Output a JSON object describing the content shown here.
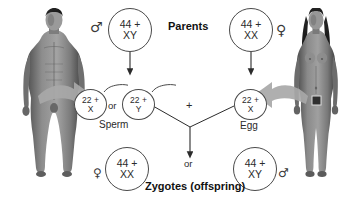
{
  "diagram": {
    "title_parents": "Parents",
    "title_offspring": "Zygotes (offspring)",
    "labels": {
      "sperm": "Sperm",
      "egg": "Egg",
      "or_left": "or",
      "or_bottom": "or",
      "plus": "+"
    },
    "symbols": {
      "male": "♂",
      "female": "♀"
    },
    "colors": {
      "ink": "#2b2b2b",
      "stroke": "#4a4a4a",
      "arrow_gray": "#9a9a9a",
      "background": "#ffffff"
    },
    "parents": [
      {
        "id": "father",
        "sex_symbol": "♂",
        "chromosome_count": "44 +",
        "sex_chromosomes": "XY"
      },
      {
        "id": "mother",
        "sex_symbol": "♀",
        "chromosome_count": "44 +",
        "sex_chromosomes": "XX"
      }
    ],
    "gametes": [
      {
        "id": "sperm-x",
        "chromosome_count": "22 +",
        "sex_chromosomes": "X",
        "label": "Sperm"
      },
      {
        "id": "sperm-y",
        "chromosome_count": "22 +",
        "sex_chromosomes": "Y",
        "label": "Sperm"
      },
      {
        "id": "egg-x",
        "chromosome_count": "22 +",
        "sex_chromosomes": "X",
        "label": "Egg"
      }
    ],
    "zygotes": [
      {
        "id": "zygote-female",
        "sex_symbol": "♀",
        "chromosome_count": "44 +",
        "sex_chromosomes": "XX"
      },
      {
        "id": "zygote-male",
        "sex_symbol": "♂",
        "chromosome_count": "44 +",
        "sex_chromosomes": "XY"
      }
    ]
  }
}
